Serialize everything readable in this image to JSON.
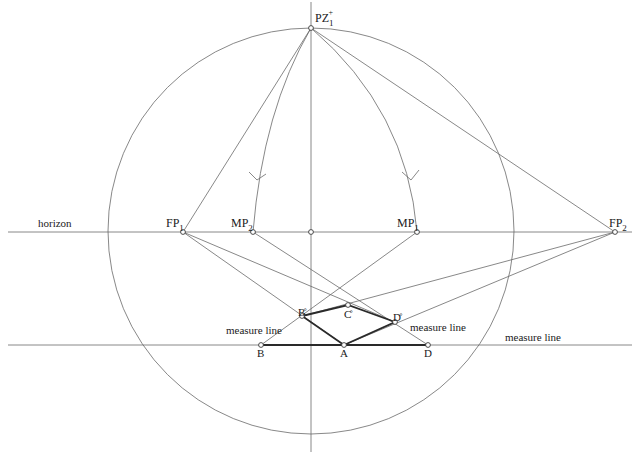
{
  "diagram": {
    "type": "perspective-construction",
    "circle": {
      "cx": 311,
      "cy": 231,
      "r": 203
    },
    "horizon": {
      "y": 232,
      "label": "horizon",
      "label_x": 38,
      "label_y": 227
    },
    "vertical_axis": {
      "x": 311,
      "y1": 2,
      "y2": 452
    },
    "measure_line": {
      "y": 345,
      "label": "measure line",
      "label_x": 505,
      "label_y": 341
    },
    "points": {
      "PZ": {
        "x": 311,
        "y": 28,
        "label": "PZ",
        "sub": "1",
        "sup": "+"
      },
      "FP1": {
        "x": 183,
        "y": 232,
        "label": "FP",
        "sub": "1"
      },
      "MP2": {
        "x": 253,
        "y": 232,
        "label": "MP",
        "sub": "2"
      },
      "H0": {
        "x": 311,
        "y": 232
      },
      "MP1": {
        "x": 417,
        "y": 232,
        "label": "MP",
        "sub": "1"
      },
      "FP2": {
        "x": 615,
        "y": 232,
        "label": "FP",
        "sub": "2"
      },
      "B": {
        "x": 261,
        "y": 345,
        "label": "B"
      },
      "A": {
        "x": 344,
        "y": 345,
        "label": "A"
      },
      "D": {
        "x": 428,
        "y": 345,
        "label": "D"
      },
      "B_ring": {
        "x": 302,
        "y": 316,
        "label": "B̊"
      },
      "C_ring": {
        "x": 348,
        "y": 305,
        "label": "C̊"
      },
      "D_ring": {
        "x": 395,
        "y": 322,
        "label": "D̊"
      }
    },
    "side_labels": [
      {
        "text": "measure line",
        "x": 226,
        "y": 334
      },
      {
        "text": "measure line",
        "x": 410,
        "y": 331
      }
    ],
    "colors": {
      "line": "#6a6a6a",
      "bold": "#2a2a2a",
      "text": "#1a1a1a",
      "background": "#ffffff"
    }
  }
}
